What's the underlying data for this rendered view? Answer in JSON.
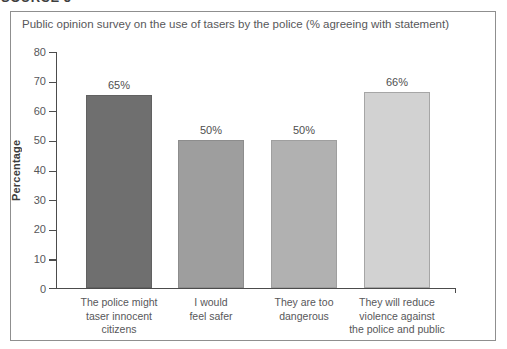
{
  "page": {
    "source_label": "SOURCE 5"
  },
  "chart_data": {
    "type": "bar",
    "title": "Public opinion survey on the use of tasers by the police (% agreeing with statement)",
    "xlabel": "",
    "ylabel": "Percentage",
    "ylim": [
      0,
      80
    ],
    "ytick_interval": 10,
    "grid": false,
    "legend": false,
    "categories": [
      "The police might taser innocent citizens",
      "I would feel safer",
      "They are too dangerous",
      "They will reduce violence against the police and public"
    ],
    "category_lines": [
      [
        "The police might",
        "taser innocent",
        "citizens"
      ],
      [
        "I would",
        "feel safer"
      ],
      [
        "They are too",
        "dangerous"
      ],
      [
        "They will reduce",
        "violence against",
        "the police and public"
      ]
    ],
    "values": [
      65,
      50,
      50,
      66
    ],
    "value_labels": [
      "65%",
      "50%",
      "50%",
      "66%"
    ],
    "bar_colors": [
      "#6f6f6f",
      "#9e9e9e",
      "#b1b1b1",
      "#d2d2d2"
    ],
    "bar_border_colors": [
      "#616161",
      "#8d8d8d",
      "#9f9f9f",
      "#a6a6a6"
    ],
    "axis_color": "#4c4c4c",
    "text_color": "#57575a"
  }
}
